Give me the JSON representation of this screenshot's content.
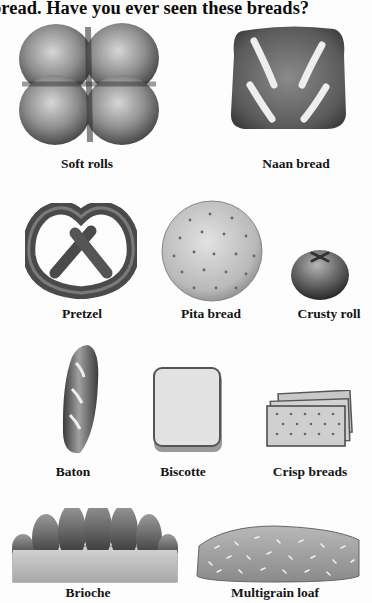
{
  "page": {
    "title": "bread. Have you ever seen these breads?"
  },
  "breads": [
    {
      "name": "Soft rolls",
      "icon": "soft-rolls-illustration"
    },
    {
      "name": "Naan bread",
      "icon": "naan-bread-illustration"
    },
    {
      "name": "Pretzel",
      "icon": "pretzel-illustration"
    },
    {
      "name": "Pita bread",
      "icon": "pita-bread-illustration"
    },
    {
      "name": "Crusty roll",
      "icon": "crusty-roll-illustration"
    },
    {
      "name": "Baton",
      "icon": "baton-illustration"
    },
    {
      "name": "Biscotte",
      "icon": "biscotte-illustration"
    },
    {
      "name": "Crisp breads",
      "icon": "crisp-breads-illustration"
    },
    {
      "name": "Brioche",
      "icon": "brioche-illustration"
    },
    {
      "name": "Multigrain loaf",
      "icon": "multigrain-loaf-illustration"
    }
  ],
  "colors": {
    "background": "#fdfdfd",
    "text": "#111111",
    "ink_dark": "#3a3a3a",
    "ink_mid": "#7a7a7a",
    "ink_light": "#c8c8c8"
  }
}
